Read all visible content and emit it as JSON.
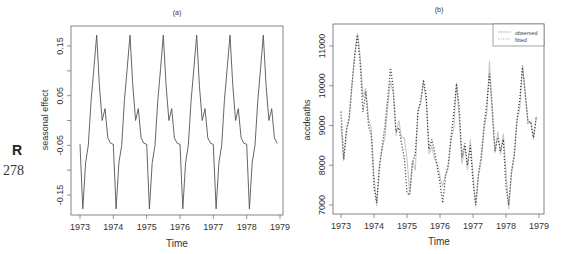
{
  "page": {
    "margin_letter": "R",
    "page_number": "278"
  },
  "chart_data": [
    {
      "id": "a",
      "type": "line",
      "title": "(a)",
      "xlabel": "Time",
      "ylabel": "seasonal effect",
      "xlim": [
        1972.92,
        1979.05
      ],
      "ylim": [
        -0.19,
        0.19
      ],
      "xticks": [
        1973,
        1974,
        1975,
        1976,
        1977,
        1978,
        1979
      ],
      "xtick_labels": [
        "1973",
        "1974",
        "1975",
        "1976",
        "1977",
        "1978",
        "1979"
      ],
      "yticks": [
        -0.15,
        -0.1,
        -0.05,
        0.0,
        0.05,
        0.1,
        0.15
      ],
      "ytick_labels": [
        "-0.15",
        "",
        "-0.05",
        "",
        "0.05",
        "",
        "0.15"
      ],
      "grid": false,
      "line_color": "#555555",
      "start": 1973,
      "frequency": 12,
      "monthly_pattern": [
        -0.048,
        -0.178,
        -0.085,
        -0.05,
        0.04,
        0.105,
        0.172,
        0.07,
        0.0,
        0.024,
        -0.035,
        -0.046
      ],
      "years": 6
    },
    {
      "id": "b",
      "type": "line",
      "title": "(b)",
      "xlabel": "Time",
      "ylabel": "accdeaths",
      "xlim": [
        1972.92,
        1979.05
      ],
      "ylim": [
        6750,
        11500
      ],
      "xticks": [
        1973,
        1974,
        1975,
        1976,
        1977,
        1978,
        1979
      ],
      "xtick_labels": [
        "1973",
        "1974",
        "1975",
        "1976",
        "1977",
        "1978",
        "1979"
      ],
      "yticks": [
        7000,
        8000,
        9000,
        10000,
        11000
      ],
      "ytick_labels": [
        "7000",
        "8000",
        "9000",
        "10000",
        "11000"
      ],
      "grid": false,
      "legend": {
        "position": "top-right",
        "entries": [
          "observed",
          "fitted"
        ]
      },
      "start": 1973,
      "frequency": 12,
      "series": [
        {
          "name": "observed",
          "style": "solid",
          "color": "#c8c8c8",
          "values": [
            9007,
            8106,
            8928,
            9137,
            10017,
            10826,
            11317,
            10744,
            9713,
            9938,
            9161,
            8927,
            7750,
            6981,
            8038,
            8422,
            8714,
            9512,
            10120,
            9823,
            8743,
            9129,
            8710,
            8680,
            8162,
            7306,
            8124,
            7870,
            9387,
            9556,
            10093,
            9620,
            8285,
            8466,
            8160,
            8034,
            7717,
            7461,
            7767,
            7925,
            8623,
            8945,
            10078,
            9179,
            8037,
            8488,
            7874,
            8647,
            7792,
            6957,
            7726,
            8106,
            8890,
            9299,
            10625,
            9302,
            8314,
            8850,
            8265,
            8796,
            7836,
            6892,
            7791,
            8192,
            9115,
            9434,
            10484,
            9827,
            9110,
            9070,
            8633,
            9240
          ]
        },
        {
          "name": "fitted",
          "style": "dotted",
          "color": "#333333",
          "values": [
            9350,
            8150,
            8850,
            9250,
            10050,
            10750,
            11280,
            10550,
            9350,
            9850,
            9000,
            8750,
            7450,
            7050,
            7950,
            8500,
            9000,
            9700,
            10450,
            9950,
            8850,
            8950,
            8550,
            8200,
            7300,
            7250,
            8050,
            8300,
            9350,
            9650,
            10150,
            9750,
            8400,
            8650,
            8350,
            7950,
            7550,
            7050,
            7700,
            8050,
            8700,
            9300,
            10050,
            9450,
            8200,
            8550,
            8000,
            8500,
            7600,
            7000,
            7800,
            8250,
            9000,
            9550,
            10300,
            9500,
            8350,
            8700,
            8350,
            8650,
            7450,
            7000,
            7850,
            8300,
            9150,
            9650,
            10500,
            9800,
            9050,
            9100,
            8700,
            9200
          ]
        }
      ]
    }
  ]
}
